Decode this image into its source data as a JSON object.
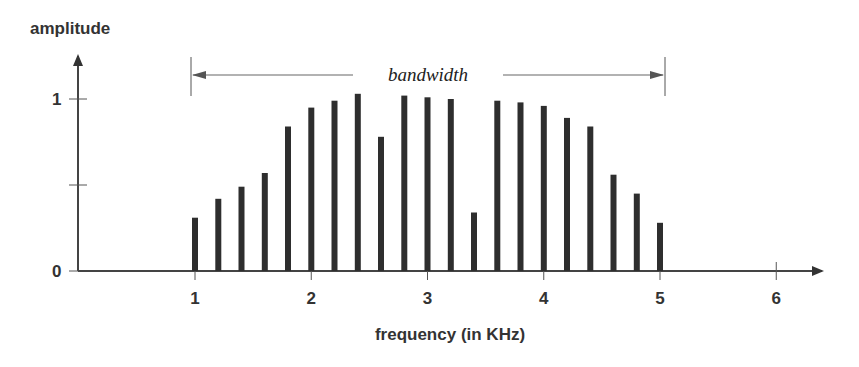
{
  "chart_data": {
    "type": "bar",
    "title": "",
    "xlabel": "frequency (in KHz)",
    "ylabel": "amplitude",
    "x_ticks": [
      "1",
      "2",
      "3",
      "4",
      "5",
      "6"
    ],
    "x_tick_values": [
      1,
      2,
      3,
      4,
      5,
      6
    ],
    "y_ticks": [
      "0",
      "1"
    ],
    "y_tick_values": [
      0,
      0.5,
      1
    ],
    "xlim": [
      0,
      6.4
    ],
    "ylim": [
      0,
      1.2
    ],
    "grid": false,
    "legend": null,
    "annotation": {
      "text": "bandwidth",
      "x_start": 1,
      "x_end": 5,
      "style": "double-headed arrow"
    },
    "x": [
      1.0,
      1.2,
      1.4,
      1.6,
      1.8,
      2.0,
      2.2,
      2.4,
      2.6,
      2.8,
      3.0,
      3.2,
      3.4,
      3.6,
      3.8,
      4.0,
      4.2,
      4.4,
      4.6,
      4.8,
      5.0
    ],
    "values": [
      0.31,
      0.42,
      0.49,
      0.57,
      0.84,
      0.95,
      0.99,
      1.03,
      0.78,
      1.02,
      1.01,
      1.0,
      0.34,
      0.99,
      0.98,
      0.96,
      0.89,
      0.84,
      0.56,
      0.45,
      0.28
    ]
  }
}
